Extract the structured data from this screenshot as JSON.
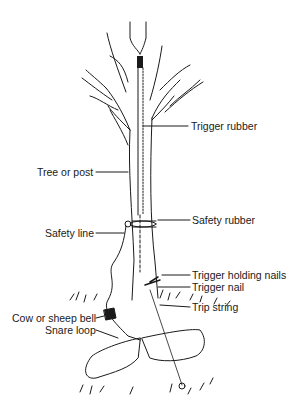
{
  "diagram": {
    "type": "labeled-illustration",
    "colors": {
      "ink": "#1a1a1a",
      "background": "#ffffff"
    },
    "labels": [
      {
        "id": "trigger-rubber",
        "text": "Trigger rubber"
      },
      {
        "id": "tree-or-post",
        "text": "Tree or post"
      },
      {
        "id": "safety-rubber",
        "text": "Safety rubber"
      },
      {
        "id": "safety-line",
        "text": "Safety line"
      },
      {
        "id": "trigger-holding-nails",
        "text": "Trigger holding nails"
      },
      {
        "id": "trigger-nail",
        "text": "Trigger nail"
      },
      {
        "id": "trip-string",
        "text": "Trip string"
      },
      {
        "id": "cow-or-sheep-bell",
        "text": "Cow or sheep bell"
      },
      {
        "id": "snare-loop",
        "text": "Snare loop"
      }
    ]
  }
}
